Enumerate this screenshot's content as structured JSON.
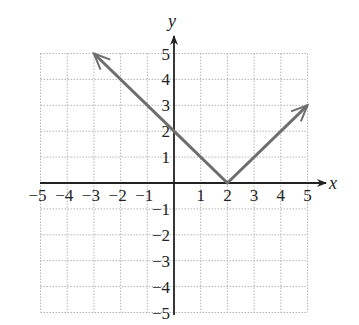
{
  "chart_data": {
    "type": "line",
    "title": "",
    "xlabel": "x",
    "ylabel": "y",
    "xlim": [
      -5,
      5
    ],
    "ylim": [
      -5,
      5
    ],
    "grid": true,
    "x_ticks": [
      "−5",
      "−4",
      "−3",
      "−2",
      "−1",
      "1",
      "2",
      "3",
      "4",
      "5"
    ],
    "y_ticks": [
      "5",
      "4",
      "3",
      "2",
      "1",
      "−1",
      "−2",
      "−3",
      "−4",
      "−5"
    ],
    "series": [
      {
        "name": "y = |x − 2|",
        "x": [
          -3,
          0,
          2,
          5
        ],
        "y": [
          5,
          2,
          0,
          3
        ],
        "arrows": "both ends",
        "color": "#6e6e6e"
      }
    ]
  },
  "labels": {
    "x_axis": "x",
    "y_axis": "y"
  }
}
